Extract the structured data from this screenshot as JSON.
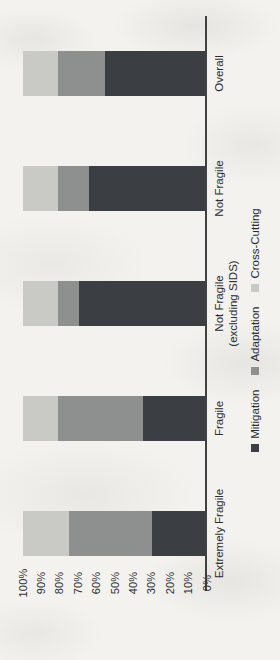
{
  "chart_data": {
    "type": "bar",
    "stacked": true,
    "orientation": "column-chart-rotated-90deg-ccw",
    "title": "",
    "xlabel": "",
    "ylabel": "",
    "ylim": [
      0,
      100
    ],
    "grid": false,
    "legend_position": "bottom",
    "categories": [
      "Extremely Fragile",
      "Fragile",
      "Not Fragile\n(excluding SIDS)",
      "Not Fragile",
      "Overall"
    ],
    "series": [
      {
        "name": "Mitigation",
        "color": "#3b3f44",
        "values": [
          29,
          34,
          69,
          64,
          55
        ]
      },
      {
        "name": "Adaptation",
        "color": "#8e908f",
        "values": [
          46,
          47,
          12,
          17,
          26
        ]
      },
      {
        "name": "Cross-Cutting",
        "color": "#c9c9c6",
        "values": [
          25,
          19,
          19,
          19,
          19
        ]
      }
    ],
    "y_ticks": [
      "0%",
      "10%",
      "20%",
      "30%",
      "40%",
      "50%",
      "60%",
      "70%",
      "80%",
      "90%",
      "100%"
    ],
    "colors": {
      "axis_line": "#414141",
      "text": "#2b2d2f",
      "page_background": "#f3f2ef"
    }
  }
}
